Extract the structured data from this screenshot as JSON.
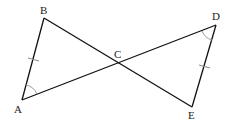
{
  "diagram": {
    "type": "geometry",
    "points": {
      "A": {
        "label": "A",
        "x": 22,
        "y": 100
      },
      "B": {
        "label": "B",
        "x": 44,
        "y": 18
      },
      "C": {
        "label": "C",
        "x": 118,
        "y": 62
      },
      "D": {
        "label": "D",
        "x": 216,
        "y": 25
      },
      "E": {
        "label": "E",
        "x": 192,
        "y": 107
      }
    },
    "segments": [
      "AB",
      "BE",
      "AD",
      "DE"
    ],
    "markings": {
      "equal_sides": [
        "AB",
        "DE"
      ],
      "equal_angles": [
        "angle A (BAC)",
        "angle D (EDC)"
      ]
    },
    "labels": {
      "A": "A",
      "B": "B",
      "C": "C",
      "D": "D",
      "E": "E"
    }
  }
}
